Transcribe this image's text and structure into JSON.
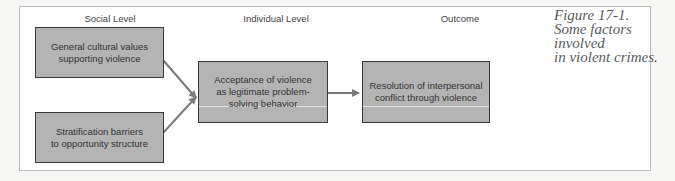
{
  "diagram": {
    "columns": [
      {
        "id": "social",
        "label": "Social Level"
      },
      {
        "id": "individual",
        "label": "Individual Level"
      },
      {
        "id": "outcome",
        "label": "Outcome"
      }
    ],
    "nodes": {
      "cultural": "General cultural values supporting violence",
      "stratification": "Stratification barriers to opportunity structure",
      "acceptance": "Acceptance of violence as legitimate problem-solving behavior",
      "resolution": "Resolution of interpersonal conflict through violence"
    },
    "node_lines": {
      "cultural": [
        "General cultural values",
        "supporting violence"
      ],
      "stratification": [
        "Stratification barriers",
        "to opportunity structure"
      ],
      "acceptance": [
        "Acceptance of violence",
        "as legitimate problem-",
        "solving behavior"
      ],
      "resolution": [
        "Resolution of interpersonal",
        "conflict through violence"
      ]
    },
    "edges": [
      {
        "from": "cultural",
        "to": "acceptance"
      },
      {
        "from": "stratification",
        "to": "acceptance"
      },
      {
        "from": "acceptance",
        "to": "resolution"
      }
    ],
    "colors": {
      "box_fill": "#b4b4b4",
      "box_border": "#3a3a3a",
      "arrow": "#7a7a7a"
    }
  },
  "caption": {
    "line1": "Figure 17-1.",
    "line2": "Some factors involved",
    "line3": "in violent crimes."
  }
}
